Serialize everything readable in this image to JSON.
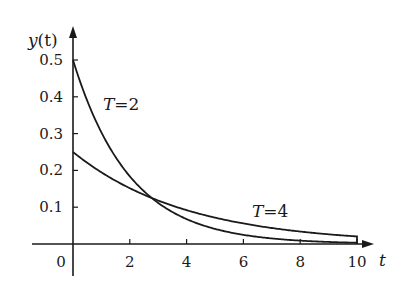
{
  "chart_data": {
    "type": "line",
    "title": "",
    "xlabel": "t",
    "ylabel": "y(t)",
    "xlim": [
      -2.3,
      10.5
    ],
    "ylim": [
      -0.03,
      0.59
    ],
    "x_ticks": [
      0,
      2,
      4,
      6,
      8,
      10
    ],
    "x_tick_labels": [
      "0",
      "2",
      "4",
      "6",
      "8",
      "10"
    ],
    "y_ticks": [
      0.1,
      0.2,
      0.3,
      0.4,
      0.5
    ],
    "y_tick_labels": [
      "0.1",
      "0.2",
      "0.3",
      "0.4",
      "0.5"
    ],
    "grid": false,
    "legend": "inline labels",
    "series": [
      {
        "name": "T=2",
        "label_T": "T",
        "label_value": "=2",
        "formula": "y = 0.5·e^(−t/2)",
        "x": [
          0,
          1,
          2,
          2.77,
          4,
          6,
          8,
          10
        ],
        "values": [
          0.5,
          0.303,
          0.184,
          0.125,
          0.068,
          0.025,
          0.009,
          0.003
        ]
      },
      {
        "name": "T=4",
        "label_T": "T",
        "label_value": "=4",
        "formula": "y = 0.25·e^(−t/4)",
        "x": [
          0,
          1,
          2,
          2.77,
          4,
          6,
          8,
          10
        ],
        "values": [
          0.25,
          0.195,
          0.152,
          0.125,
          0.092,
          0.056,
          0.034,
          0.021
        ]
      }
    ],
    "annotations": [
      {
        "text": "T=2",
        "near": "upper curve, t≈1.5"
      },
      {
        "text": "T=4",
        "near": "lower-right curve, t≈6.5"
      }
    ]
  },
  "axes": {
    "y_label_main": "y",
    "y_label_paren": "(t)",
    "x_label": "t",
    "origin_label": "0"
  }
}
